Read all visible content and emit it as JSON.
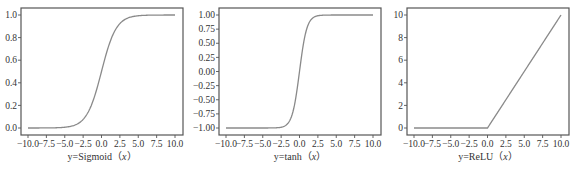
{
  "chart_data": [
    {
      "type": "line",
      "title": "",
      "xlabel": "y=Sigmoid（x）",
      "xlabel_prefix": "y=Sigmoid（",
      "xlabel_var": "x",
      "xlabel_suffix": "）",
      "ylabel": "",
      "xlim": [
        -10,
        10
      ],
      "ylim": [
        0,
        1
      ],
      "xticks": [
        -10.0,
        -7.5,
        -5.0,
        -2.5,
        0.0,
        2.5,
        5.0,
        7.5,
        10.0
      ],
      "xtick_labels": [
        "−10.0",
        "−7.5",
        "−5.0",
        "−2.5",
        "0.0",
        "2.5",
        "5.0",
        "7.5",
        "10.0"
      ],
      "yticks": [
        0.0,
        0.2,
        0.4,
        0.6,
        0.8,
        1.0
      ],
      "ytick_labels": [
        "0.0",
        "0.2",
        "0.4",
        "0.6",
        "0.8",
        "1.0"
      ],
      "function": "sigmoid",
      "series": [
        {
          "name": "Sigmoid",
          "x": [
            -10,
            -7.5,
            -5,
            -2.5,
            0,
            2.5,
            5,
            7.5,
            10
          ],
          "values": [
            0.0,
            0.0006,
            0.0067,
            0.0759,
            0.5,
            0.9241,
            0.9933,
            0.9994,
            1.0
          ]
        }
      ],
      "grid": false,
      "line_color": "#8a8a8a"
    },
    {
      "type": "line",
      "title": "",
      "xlabel": "y=tanh（x）",
      "xlabel_prefix": "y=tanh（",
      "xlabel_var": "x",
      "xlabel_suffix": "）",
      "ylabel": "",
      "xlim": [
        -10,
        10
      ],
      "ylim": [
        -1,
        1
      ],
      "xticks": [
        -10.0,
        -7.5,
        -5.0,
        -2.5,
        0.0,
        2.5,
        5.0,
        7.5,
        10.0
      ],
      "xtick_labels": [
        "−10.0",
        "−7.5",
        "−5.0",
        "−2.5",
        "0.0",
        "2.5",
        "5.0",
        "7.5",
        "10.0"
      ],
      "yticks": [
        -1.0,
        -0.75,
        -0.5,
        -0.25,
        0.0,
        0.25,
        0.5,
        0.75,
        1.0
      ],
      "ytick_labels": [
        "−1.00",
        "−0.75",
        "−0.50",
        "−0.25",
        "0.00",
        "0.25",
        "0.50",
        "0.75",
        "1.00"
      ],
      "function": "tanh",
      "series": [
        {
          "name": "tanh",
          "x": [
            -10,
            -7.5,
            -5,
            -2.5,
            0,
            2.5,
            5,
            7.5,
            10
          ],
          "values": [
            -1.0,
            -1.0,
            -0.9999,
            -0.9866,
            0.0,
            0.9866,
            0.9999,
            1.0,
            1.0
          ]
        }
      ],
      "grid": false,
      "line_color": "#8a8a8a"
    },
    {
      "type": "line",
      "title": "",
      "xlabel": "y=ReLU（x）",
      "xlabel_prefix": "y=ReLU（",
      "xlabel_var": "x",
      "xlabel_suffix": "）",
      "ylabel": "",
      "xlim": [
        -10,
        10
      ],
      "ylim": [
        0,
        10
      ],
      "xticks": [
        -10.0,
        -7.5,
        -5.0,
        -2.5,
        0.0,
        2.5,
        5.0,
        7.5,
        10.0
      ],
      "xtick_labels": [
        "−10.0",
        "−7.5",
        "−5.0",
        "−2.5",
        "0.0",
        "2.5",
        "5.0",
        "7.5",
        "10.0"
      ],
      "yticks": [
        0,
        2,
        4,
        6,
        8,
        10
      ],
      "ytick_labels": [
        "0",
        "2",
        "4",
        "6",
        "8",
        "10"
      ],
      "function": "relu",
      "series": [
        {
          "name": "ReLU",
          "x": [
            -10,
            -7.5,
            -5,
            -2.5,
            0,
            2.5,
            5,
            7.5,
            10
          ],
          "values": [
            0,
            0,
            0,
            0,
            0,
            2.5,
            5,
            7.5,
            10
          ]
        }
      ],
      "grid": false,
      "line_color": "#8a8a8a"
    }
  ],
  "colors": {
    "frame": "#555555",
    "line": "#8a8a8a",
    "text": "#333333",
    "background": "#ffffff"
  }
}
